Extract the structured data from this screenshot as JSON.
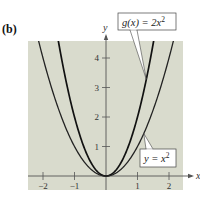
{
  "panel_label": "(b)",
  "colors": {
    "plot_background": "#d9dbcd",
    "axis": "#555555",
    "curve_g": "#111111",
    "curve_f": "#222222",
    "label_box_fill": "#ffffff",
    "label_box_stroke": "#444444"
  },
  "chart_data": {
    "type": "line",
    "title": "",
    "xlabel": "x",
    "ylabel": "y",
    "xlim": [
      -2.5,
      2.4
    ],
    "ylim": [
      -0.45,
      4.6
    ],
    "x_ticks": [
      -2,
      -1,
      1,
      2
    ],
    "x_tick_labels": [
      "−2",
      "−1",
      "1",
      "2"
    ],
    "y_ticks": [
      1,
      2,
      3,
      4
    ],
    "y_tick_labels": [
      "1",
      "2",
      "3",
      "4"
    ],
    "grid": false,
    "series": [
      {
        "name": "g(x) = 2x^2",
        "label_text": "g(x) = 2x",
        "label_exponent": "2",
        "function": "2*x^2",
        "coefficient": 2,
        "x": [
          -1.5,
          -1.25,
          -1,
          -0.75,
          -0.5,
          -0.25,
          0,
          0.25,
          0.5,
          0.75,
          1,
          1.25,
          1.5
        ],
        "y": [
          4.5,
          3.125,
          2,
          1.125,
          0.5,
          0.125,
          0,
          0.125,
          0.5,
          1.125,
          2,
          3.125,
          4.5
        ]
      },
      {
        "name": "y = x^2",
        "label_text": "y = x",
        "label_exponent": "2",
        "function": "x^2",
        "coefficient": 1,
        "x": [
          -2.1,
          -2,
          -1.5,
          -1,
          -0.5,
          0,
          0.5,
          1,
          1.5,
          2,
          2.1
        ],
        "y": [
          4.41,
          4,
          2.25,
          1,
          0.25,
          0,
          0.25,
          1,
          2.25,
          4,
          4.41
        ]
      }
    ],
    "annotations": [
      {
        "series": "g(x) = 2x^2",
        "anchor_x": 1.28,
        "placement": "top-right"
      },
      {
        "series": "y = x^2",
        "anchor_x": 1.2,
        "placement": "bottom-right"
      }
    ]
  }
}
